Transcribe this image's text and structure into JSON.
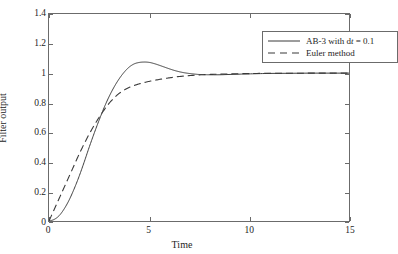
{
  "chart_data": {
    "type": "line",
    "title": "",
    "xlabel": "Time",
    "ylabel": "Filter output",
    "xlim": [
      0,
      15
    ],
    "ylim": [
      0,
      1.4
    ],
    "xticks": [
      "0",
      "5",
      "10",
      "15"
    ],
    "xtick_values": [
      0,
      5,
      10,
      15
    ],
    "yticks": [
      "0",
      "0.2",
      "0.4",
      "0.6",
      "0.8",
      "1",
      "1.2",
      "1.4"
    ],
    "ytick_values": [
      0,
      0.2,
      0.4,
      0.6,
      0.8,
      1,
      1.2,
      1.4
    ],
    "grid": false,
    "legend_position": "top-right",
    "series": [
      {
        "name": "AB-3 with dt = 0.1",
        "name_prefix": "AB-3 with d",
        "name_italic": "t",
        "name_suffix": " = 0.1",
        "style": "solid",
        "color": "#3a3a3a",
        "x": [
          0,
          0.25,
          0.5,
          0.75,
          1,
          1.25,
          1.5,
          1.75,
          2,
          2.25,
          2.5,
          2.75,
          3,
          3.25,
          3.5,
          3.75,
          4,
          4.25,
          4.5,
          4.75,
          5,
          5.25,
          5.5,
          5.75,
          6,
          6.25,
          6.5,
          6.75,
          7,
          7.25,
          7.5,
          7.75,
          8,
          8.5,
          9,
          9.5,
          10,
          11,
          12,
          13,
          14,
          15
        ],
        "y": [
          0,
          0.01,
          0.035,
          0.08,
          0.14,
          0.215,
          0.3,
          0.395,
          0.495,
          0.59,
          0.68,
          0.765,
          0.84,
          0.905,
          0.96,
          1.005,
          1.04,
          1.062,
          1.072,
          1.075,
          1.073,
          1.065,
          1.054,
          1.042,
          1.03,
          1.019,
          1.01,
          1.003,
          0.998,
          0.994,
          0.991,
          0.99,
          0.989,
          0.989,
          0.991,
          0.993,
          0.995,
          0.998,
          0.999,
          1.0,
          1.0,
          1.0
        ]
      },
      {
        "name": "Euler method",
        "style": "dashed",
        "color": "#3a3a3a",
        "x": [
          0,
          0.25,
          0.5,
          0.75,
          1,
          1.25,
          1.5,
          1.75,
          2,
          2.25,
          2.5,
          2.75,
          3,
          3.25,
          3.5,
          3.75,
          4,
          4.25,
          4.5,
          4.75,
          5,
          5.5,
          6,
          6.5,
          7,
          7.5,
          8,
          9,
          10,
          11,
          12,
          13,
          14,
          15
        ],
        "y": [
          0,
          0.075,
          0.15,
          0.225,
          0.3,
          0.375,
          0.45,
          0.52,
          0.585,
          0.645,
          0.7,
          0.75,
          0.795,
          0.832,
          0.862,
          0.885,
          0.903,
          0.916,
          0.927,
          0.936,
          0.944,
          0.957,
          0.968,
          0.977,
          0.983,
          0.988,
          0.991,
          0.995,
          0.997,
          0.999,
          0.999,
          1.0,
          1.0,
          1.0
        ]
      }
    ],
    "legend_entries": [
      {
        "label": "AB-3 with dt = 0.1",
        "style": "solid"
      },
      {
        "label": "Euler method",
        "style": "dashed"
      }
    ]
  },
  "axes": {
    "x_title": "Time",
    "y_title": "Filter output"
  },
  "legend": {
    "entry1_prefix": "AB-3 with d",
    "entry1_italic": "t",
    "entry1_suffix": " = 0.1",
    "entry2": "Euler method"
  },
  "ticks": {
    "y": [
      "1.4",
      "1.2",
      "1",
      "0.8",
      "0.6",
      "0.4",
      "0.2",
      "0"
    ],
    "x": [
      "0",
      "5",
      "10",
      "15"
    ]
  },
  "colors": {
    "line": "#3a3a3a",
    "axis": "#6b6b6b",
    "text": "#1d1d1d",
    "background": "#ffffff"
  }
}
